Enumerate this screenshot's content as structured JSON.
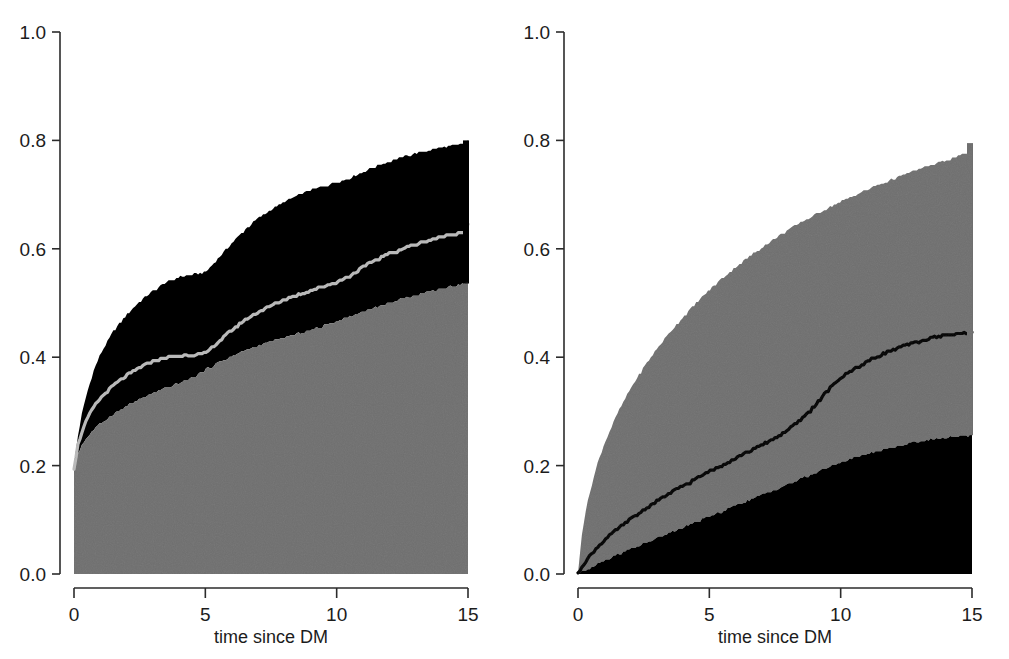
{
  "figure": {
    "background_color": "#ffffff",
    "panel_count": 2,
    "gray_color": "#6f6f6f",
    "black_color": "#000000",
    "line_light_color": "#b9b9b9",
    "line_dark_color": "#000000",
    "axis_color": "#2b2b2b"
  },
  "axes": {
    "y_ticks": [
      "0.0",
      "0.2",
      "0.4",
      "0.6",
      "0.8",
      "1.0"
    ],
    "y_tick_values": [
      0.0,
      0.2,
      0.4,
      0.6,
      0.8,
      1.0
    ],
    "y_min": 0.0,
    "y_max": 1.0,
    "x_ticks": [
      "0",
      "5",
      "10",
      "15"
    ],
    "x_tick_values": [
      0,
      5,
      10,
      15
    ],
    "x_min": 0,
    "x_max": 15,
    "x_title": "time since DM",
    "y_title": ""
  },
  "chart_data": [
    {
      "type": "area",
      "panel": "left",
      "title": "",
      "xlabel": "time since DM",
      "ylabel": "",
      "xlim": [
        0,
        15
      ],
      "ylim": [
        0,
        1
      ],
      "grid": false,
      "legend": "none",
      "x": [
        0,
        0.15,
        0.3,
        0.5,
        0.75,
        1,
        1.5,
        2,
        2.5,
        3,
        3.5,
        4,
        4.5,
        5,
        5.5,
        6,
        6.5,
        7,
        7.5,
        8,
        8.5,
        9,
        9.5,
        10,
        10.5,
        11,
        11.5,
        12,
        12.5,
        13,
        13.5,
        14,
        14.5,
        14.9,
        15
      ],
      "series": [
        {
          "name": "upper-band-top",
          "color": "#000000",
          "values": [
            0.2,
            0.255,
            0.295,
            0.335,
            0.375,
            0.405,
            0.448,
            0.478,
            0.503,
            0.522,
            0.538,
            0.548,
            0.553,
            0.556,
            0.583,
            0.61,
            0.635,
            0.656,
            0.672,
            0.686,
            0.698,
            0.708,
            0.716,
            0.722,
            0.731,
            0.742,
            0.752,
            0.761,
            0.769,
            0.776,
            0.782,
            0.787,
            0.791,
            0.794,
            0.8
          ]
        },
        {
          "name": "estimate-curve",
          "color": "#b9b9b9",
          "values": [
            0.195,
            0.238,
            0.262,
            0.286,
            0.308,
            0.324,
            0.348,
            0.366,
            0.381,
            0.392,
            0.399,
            0.403,
            0.405,
            0.407,
            0.428,
            0.45,
            0.468,
            0.483,
            0.495,
            0.506,
            0.515,
            0.523,
            0.531,
            0.538,
            0.55,
            0.566,
            0.58,
            0.591,
            0.6,
            0.608,
            0.616,
            0.622,
            0.628,
            0.632,
            0.645
          ]
        },
        {
          "name": "lower-band-top",
          "color": "#6f6f6f",
          "values": [
            0.19,
            0.222,
            0.238,
            0.252,
            0.266,
            0.277,
            0.295,
            0.31,
            0.322,
            0.333,
            0.343,
            0.352,
            0.362,
            0.377,
            0.39,
            0.402,
            0.412,
            0.421,
            0.429,
            0.436,
            0.443,
            0.45,
            0.458,
            0.466,
            0.475,
            0.484,
            0.492,
            0.5,
            0.508,
            0.515,
            0.521,
            0.527,
            0.532,
            0.536,
            0.54
          ]
        }
      ]
    },
    {
      "type": "area",
      "panel": "right",
      "title": "",
      "xlabel": "time since DM",
      "ylabel": "",
      "xlim": [
        0,
        15
      ],
      "ylim": [
        0,
        1
      ],
      "grid": false,
      "legend": "none",
      "x": [
        0,
        0.15,
        0.3,
        0.5,
        0.75,
        1,
        1.5,
        2,
        2.5,
        3,
        3.5,
        4,
        4.5,
        5,
        5.5,
        6,
        6.5,
        7,
        7.5,
        8,
        8.5,
        9,
        9.5,
        10,
        10.5,
        11,
        11.5,
        12,
        12.5,
        13,
        13.5,
        14,
        14.5,
        14.9,
        15
      ],
      "series": [
        {
          "name": "upper-band-top",
          "color": "#6f6f6f",
          "values": [
            0.0,
            0.075,
            0.118,
            0.16,
            0.205,
            0.24,
            0.296,
            0.342,
            0.381,
            0.415,
            0.446,
            0.474,
            0.5,
            0.524,
            0.546,
            0.566,
            0.585,
            0.603,
            0.619,
            0.635,
            0.649,
            0.662,
            0.675,
            0.687,
            0.698,
            0.709,
            0.719,
            0.729,
            0.738,
            0.747,
            0.755,
            0.763,
            0.771,
            0.778,
            0.795
          ]
        },
        {
          "name": "estimate-curve",
          "color": "#000000",
          "values": [
            0.0,
            0.014,
            0.024,
            0.036,
            0.05,
            0.062,
            0.083,
            0.101,
            0.118,
            0.134,
            0.149,
            0.163,
            0.176,
            0.189,
            0.202,
            0.214,
            0.226,
            0.238,
            0.251,
            0.266,
            0.285,
            0.31,
            0.338,
            0.362,
            0.378,
            0.392,
            0.404,
            0.414,
            0.422,
            0.429,
            0.436,
            0.441,
            0.444,
            0.445,
            0.446
          ]
        },
        {
          "name": "lower-band-top",
          "color": "#000000",
          "values": [
            0.0,
            0.004,
            0.008,
            0.013,
            0.019,
            0.025,
            0.036,
            0.046,
            0.056,
            0.066,
            0.076,
            0.086,
            0.096,
            0.106,
            0.116,
            0.126,
            0.136,
            0.146,
            0.156,
            0.166,
            0.176,
            0.186,
            0.196,
            0.206,
            0.214,
            0.221,
            0.228,
            0.234,
            0.24,
            0.245,
            0.249,
            0.252,
            0.254,
            0.255,
            0.256
          ]
        }
      ]
    }
  ]
}
